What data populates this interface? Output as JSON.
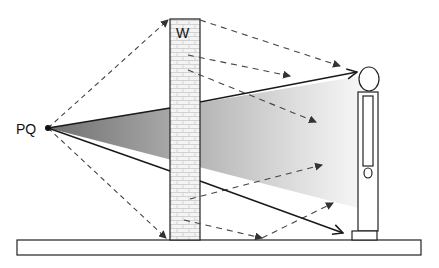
{
  "diagram": {
    "source_label": "PQ",
    "wall_label": "W",
    "colors": {
      "line": "#1a1a1a",
      "dashed": "#444444",
      "beam_start": "#7a7a7a",
      "beam_end": "#ffffff",
      "wall_fill": "#f2f2f2",
      "wall_brick": "#c8c8c8"
    },
    "elements": [
      {
        "name": "source-point",
        "label": "PQ"
      },
      {
        "name": "wall",
        "label": "W"
      },
      {
        "name": "observer-figure"
      },
      {
        "name": "ground-slab"
      },
      {
        "name": "direct-beam-shadow"
      }
    ]
  }
}
